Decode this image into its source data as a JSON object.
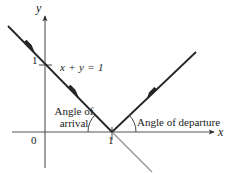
{
  "figure": {
    "name": "angle-of-arrival-departure-root-locus-diagram",
    "axes": {
      "x_label": "x",
      "y_label": "y",
      "origin_label": "0",
      "x_tick_label": "1",
      "y_tick_label": "1"
    },
    "annotations": {
      "line_equation": "x + y = 1",
      "angle_arrival": "Angle of arrival",
      "angle_departure": "Angle of departure"
    },
    "colors": {
      "curve": "#262626",
      "axis": "#555555",
      "ghost_line": "#9a9a9a",
      "text": "#1a1a1a",
      "background": "#ffffff"
    },
    "geometry": {
      "origin_px": [
        45,
        132
      ],
      "intersection_px": [
        112,
        132
      ],
      "y_tick_px": [
        45,
        65
      ],
      "incoming_line_from_px": [
        8,
        26
      ],
      "incoming_line_to_px": [
        112,
        132
      ],
      "outgoing_line_from_px": [
        112,
        132
      ],
      "outgoing_line_to_px": [
        196,
        52
      ],
      "ghost_line_from_px": [
        112,
        132
      ],
      "ghost_line_to_px": [
        152,
        172
      ],
      "arrival_arc_radius_px": 24,
      "departure_arc_radius_px": 24
    }
  }
}
